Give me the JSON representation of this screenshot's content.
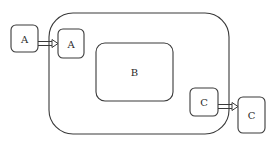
{
  "diagram": {
    "container": {
      "label": ""
    },
    "nodes": {
      "outer_a": {
        "label": "A"
      },
      "inner_a": {
        "label": "A"
      },
      "b": {
        "label": "B"
      },
      "inner_c": {
        "label": "C"
      },
      "outer_c": {
        "label": "C"
      }
    },
    "edges": [
      {
        "from": "outer_a",
        "to": "inner_a",
        "style": "double-line-arrow"
      },
      {
        "from": "inner_c",
        "to": "outer_c",
        "style": "double-line-arrow"
      }
    ],
    "colors": {
      "stroke": "#3a3a3a",
      "fill": "#ffffff",
      "text": "#2a2a2a"
    }
  }
}
